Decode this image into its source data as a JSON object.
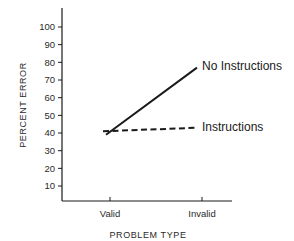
{
  "chart_data": {
    "type": "line",
    "title": "",
    "xlabel": "PROBLEM TYPE",
    "ylabel": "PERCENT ERROR",
    "categories": [
      "Valid",
      "Invalid"
    ],
    "series": [
      {
        "name": "No Instructions",
        "values": [
          39,
          77
        ],
        "style": "solid"
      },
      {
        "name": "Instructions",
        "values": [
          41,
          43
        ],
        "style": "dashed"
      }
    ],
    "ylim": [
      0,
      110
    ],
    "yticks": [
      10,
      20,
      30,
      40,
      50,
      60,
      70,
      80,
      90,
      100
    ],
    "grid": false,
    "legend": "inline labels at line ends"
  },
  "labels": {
    "ylabel": "PERCENT ERROR",
    "xlabel": "PROBLEM TYPE",
    "cat0": "Valid",
    "cat1": "Invalid",
    "series0": "No Instructions",
    "series1": "Instructions",
    "yt": [
      "10",
      "20",
      "30",
      "40",
      "50",
      "60",
      "70",
      "80",
      "90",
      "100"
    ]
  },
  "colors": {
    "ink": "#1a1a1a",
    "background": "#ffffff"
  }
}
